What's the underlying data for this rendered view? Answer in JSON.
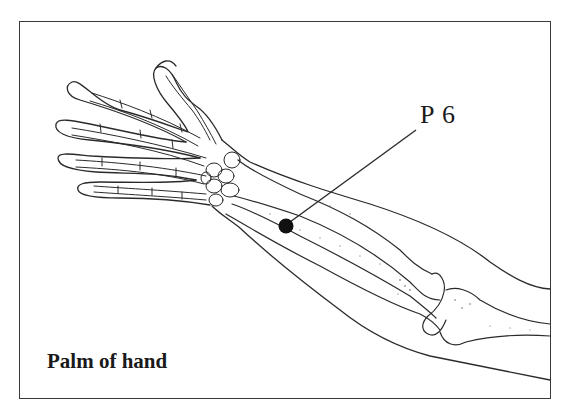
{
  "figure": {
    "point_label": "P 6",
    "caption": "Palm of hand",
    "point_marker_color": "#111111",
    "line_color": "#2a2a2a"
  }
}
